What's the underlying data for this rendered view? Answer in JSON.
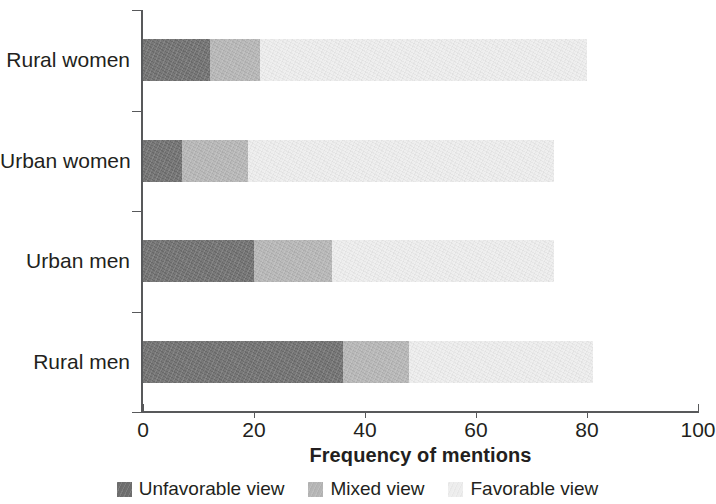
{
  "chart_data": {
    "type": "bar",
    "subtype": "horizontal-stacked",
    "title": "",
    "xlabel": "Frequency of mentions",
    "ylabel": "",
    "xlim": [
      0,
      100
    ],
    "xticks": [
      0,
      20,
      40,
      60,
      80,
      100
    ],
    "xtick_labels": [
      "0",
      "20",
      "40",
      "60",
      "80",
      "100"
    ],
    "grid": false,
    "legend_position": "bottom",
    "categories": [
      "Rural women",
      "Urban women",
      "Urban men",
      "Rural men"
    ],
    "series": [
      {
        "name": "Unfavorable view",
        "color": "#6e6e6e",
        "values": [
          12,
          7,
          20,
          36
        ]
      },
      {
        "name": "Mixed view",
        "color": "#b5b5b5",
        "values": [
          9,
          12,
          14,
          12
        ]
      },
      {
        "name": "Favorable view",
        "color": "#ededed",
        "values": [
          59,
          55,
          40,
          33
        ]
      }
    ],
    "totals": [
      80,
      74,
      74,
      81
    ]
  },
  "axis": {
    "x_title": "Frequency of mentions"
  },
  "legend": {
    "items": [
      {
        "label": "Unfavorable view",
        "color": "#6e6e6e"
      },
      {
        "label": "Mixed view",
        "color": "#b5b5b5"
      },
      {
        "label": "Favorable view",
        "color": "#ededed"
      }
    ]
  }
}
